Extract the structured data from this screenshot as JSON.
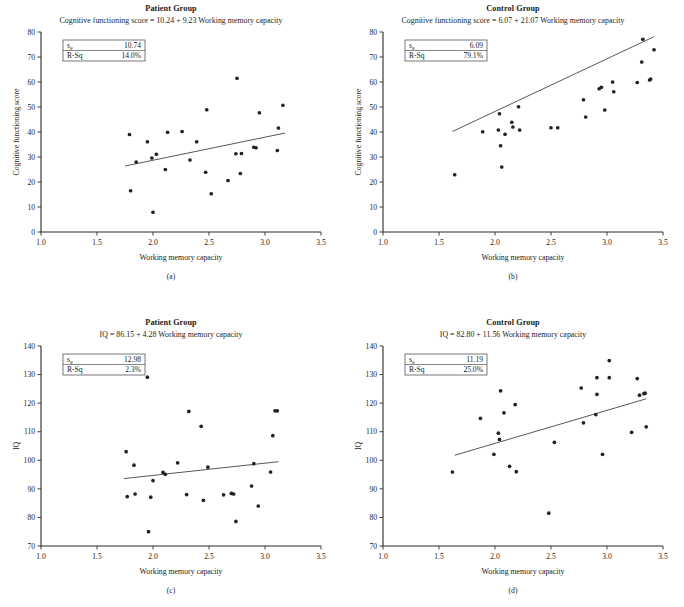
{
  "figure": {
    "panel_count": 4,
    "shared_xlabel": "Working memory capacity"
  },
  "chart_data": [
    {
      "id": "a",
      "type": "scatter",
      "panel_label": "(a)",
      "title": "Patient Group",
      "subtitle": "Cognitive functioning score = 10.24 + 9.23 Working memory capacity",
      "xlabel": "Working memory capacity",
      "ylabel": "Cognitive functioning score",
      "xlim": [
        1.0,
        3.5
      ],
      "ylim": [
        0,
        80
      ],
      "xticks": [
        "1.0",
        "1.5",
        "2.0",
        "2.5",
        "3.0",
        "3.5"
      ],
      "yticks": [
        "0",
        "10",
        "20",
        "30",
        "40",
        "50",
        "60",
        "70",
        "80"
      ],
      "grid": false,
      "legend": "none",
      "stats": {
        "se_label": "s",
        "se_sub": "e",
        "se_value": "10.74",
        "rsq_label": "R-Sq",
        "rsq_value": "14.0%"
      },
      "fit": {
        "intercept": 10.24,
        "slope": 9.23,
        "x_start": 1.75,
        "x_end": 3.18
      },
      "points": [
        [
          1.79,
          39.0
        ],
        [
          1.8,
          16.5
        ],
        [
          1.85,
          28.0
        ],
        [
          1.95,
          36.1
        ],
        [
          1.99,
          29.6
        ],
        [
          2.0,
          7.9
        ],
        [
          2.03,
          31.1
        ],
        [
          2.11,
          25.0
        ],
        [
          2.13,
          39.9
        ],
        [
          2.26,
          40.2
        ],
        [
          2.33,
          28.8
        ],
        [
          2.39,
          36.1
        ],
        [
          2.47,
          23.9
        ],
        [
          2.48,
          48.9
        ],
        [
          2.52,
          15.3
        ],
        [
          2.67,
          20.6
        ],
        [
          2.74,
          31.3
        ],
        [
          2.75,
          61.5
        ],
        [
          2.78,
          23.4
        ],
        [
          2.79,
          31.4
        ],
        [
          2.9,
          33.9
        ],
        [
          2.92,
          33.7
        ],
        [
          2.95,
          47.7
        ],
        [
          3.11,
          32.6
        ],
        [
          3.12,
          41.6
        ],
        [
          3.16,
          50.7
        ]
      ]
    },
    {
      "id": "b",
      "type": "scatter",
      "panel_label": "(b)",
      "title": "Control Group",
      "subtitle": "Cognitive functioning score = 6.07 + 21.07 Working memory capacity",
      "xlabel": "Working memory capacity",
      "ylabel": "Cognitive functioning score",
      "xlim": [
        1.0,
        3.5
      ],
      "ylim": [
        0,
        80
      ],
      "xticks": [
        "1.0",
        "1.5",
        "2.0",
        "2.5",
        "3.0",
        "3.5"
      ],
      "yticks": [
        "0",
        "10",
        "20",
        "30",
        "40",
        "50",
        "60",
        "70",
        "80"
      ],
      "grid": false,
      "legend": "none",
      "stats": {
        "se_label": "s",
        "se_sub": "e",
        "se_value": "6.09",
        "rsq_label": "R-Sq",
        "rsq_value": "79.1%"
      },
      "fit": {
        "intercept": 6.07,
        "slope": 21.07,
        "x_start": 1.62,
        "x_end": 3.42
      },
      "points": [
        [
          1.64,
          22.9
        ],
        [
          1.89,
          40.1
        ],
        [
          2.03,
          40.8
        ],
        [
          2.04,
          47.3
        ],
        [
          2.05,
          34.5
        ],
        [
          2.06,
          26.0
        ],
        [
          2.09,
          39.1
        ],
        [
          2.15,
          43.9
        ],
        [
          2.16,
          42.0
        ],
        [
          2.21,
          50.1
        ],
        [
          2.22,
          40.8
        ],
        [
          2.5,
          41.7
        ],
        [
          2.56,
          41.7
        ],
        [
          2.81,
          46.0
        ],
        [
          2.79,
          52.9
        ],
        [
          2.93,
          57.3
        ],
        [
          2.95,
          57.9
        ],
        [
          2.98,
          48.8
        ],
        [
          3.05,
          60.0
        ],
        [
          3.06,
          56.1
        ],
        [
          3.27,
          59.8
        ],
        [
          3.31,
          68.0
        ],
        [
          3.32,
          77.1
        ],
        [
          3.38,
          60.8
        ],
        [
          3.39,
          61.2
        ],
        [
          3.42,
          72.9
        ]
      ]
    },
    {
      "id": "c",
      "type": "scatter",
      "panel_label": "(c)",
      "title": "Patient Group",
      "subtitle": "IQ = 86.15 + 4.28 Working memory capacity",
      "xlabel": "Working memory capacity",
      "ylabel": "IQ",
      "xlim": [
        1.0,
        3.5
      ],
      "ylim": [
        70,
        140
      ],
      "xticks": [
        "1.0",
        "1.5",
        "2.0",
        "2.5",
        "3.0",
        "3.5"
      ],
      "yticks": [
        "70",
        "80",
        "90",
        "100",
        "110",
        "120",
        "130",
        "140"
      ],
      "grid": false,
      "legend": "none",
      "stats": {
        "se_label": "s",
        "se_sub": "e",
        "se_value": "12.98",
        "rsq_label": "R-Sq",
        "rsq_value": "2.3%"
      },
      "fit": {
        "intercept": 86.15,
        "slope": 4.28,
        "x_start": 1.74,
        "x_end": 3.12
      },
      "points": [
        [
          1.76,
          103.0
        ],
        [
          1.77,
          87.3
        ],
        [
          1.83,
          98.3
        ],
        [
          1.84,
          88.2
        ],
        [
          1.95,
          129.1
        ],
        [
          1.96,
          75.0
        ],
        [
          1.98,
          87.1
        ],
        [
          2.0,
          92.9
        ],
        [
          2.09,
          95.8
        ],
        [
          2.11,
          95.1
        ],
        [
          2.22,
          99.1
        ],
        [
          2.3,
          88.0
        ],
        [
          2.32,
          117.1
        ],
        [
          2.43,
          111.9
        ],
        [
          2.45,
          86.0
        ],
        [
          2.49,
          97.6
        ],
        [
          2.63,
          87.9
        ],
        [
          2.7,
          88.4
        ],
        [
          2.72,
          88.2
        ],
        [
          2.74,
          78.6
        ],
        [
          2.88,
          91.0
        ],
        [
          2.9,
          98.8
        ],
        [
          2.94,
          84.0
        ],
        [
          3.05,
          95.9
        ],
        [
          3.07,
          108.6
        ],
        [
          3.09,
          117.3
        ],
        [
          3.11,
          117.3
        ]
      ]
    },
    {
      "id": "d",
      "type": "scatter",
      "panel_label": "(d)",
      "title": "Control Group",
      "subtitle": "IQ = 82.80 + 11.56 Working memory capacity",
      "xlabel": "Working memory capacity",
      "ylabel": "IQ",
      "xlim": [
        1.0,
        3.5
      ],
      "ylim": [
        70,
        140
      ],
      "xticks": [
        "1.0",
        "1.5",
        "2.0",
        "2.5",
        "3.0",
        "3.5"
      ],
      "yticks": [
        "70",
        "80",
        "90",
        "100",
        "110",
        "120",
        "130",
        "140"
      ],
      "grid": false,
      "legend": "none",
      "stats": {
        "se_label": "s",
        "se_sub": "e",
        "se_value": "11.19",
        "rsq_label": "R-Sq",
        "rsq_value": "25.0%"
      },
      "fit": {
        "intercept": 82.8,
        "slope": 11.56,
        "x_start": 1.64,
        "x_end": 3.35
      },
      "points": [
        [
          1.62,
          95.9
        ],
        [
          1.87,
          114.7
        ],
        [
          1.99,
          102.1
        ],
        [
          2.03,
          109.5
        ],
        [
          2.04,
          107.3
        ],
        [
          2.05,
          124.3
        ],
        [
          2.08,
          116.6
        ],
        [
          2.13,
          97.9
        ],
        [
          2.18,
          119.5
        ],
        [
          2.19,
          96.0
        ],
        [
          2.48,
          81.5
        ],
        [
          2.53,
          106.3
        ],
        [
          2.77,
          125.3
        ],
        [
          2.79,
          113.1
        ],
        [
          2.9,
          116.0
        ],
        [
          2.91,
          128.9
        ],
        [
          2.91,
          123.1
        ],
        [
          2.96,
          102.1
        ],
        [
          3.02,
          128.9
        ],
        [
          3.02,
          134.9
        ],
        [
          3.22,
          109.8
        ],
        [
          3.27,
          128.6
        ],
        [
          3.29,
          122.8
        ],
        [
          3.33,
          123.3
        ],
        [
          3.34,
          123.5
        ],
        [
          3.35,
          111.7
        ]
      ]
    }
  ]
}
